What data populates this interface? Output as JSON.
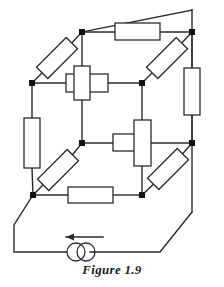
{
  "figure": {
    "caption": "Figure 1.9",
    "title": "Figure 1.9",
    "type": "circuit-schematic",
    "colors": {
      "wire": "#2b2b2b",
      "node": "#111111",
      "resistor_fill": "#ffffff",
      "resistor_stroke": "#2b2b2b",
      "background": "#ffffff",
      "caption_color": "#1a1a1a"
    },
    "stroke_width": 1.4
  },
  "circuit": {
    "element_counts": {
      "resistors": 12,
      "nodes": 8,
      "sources": 1
    },
    "source": {
      "kind": "current-source",
      "symbol": "two-overlapping-circles",
      "arrow_direction": "left",
      "cx": 81,
      "cy": 252,
      "r": 9
    },
    "nodes": [
      {
        "id": "top-back-left",
        "x": 82,
        "y": 32,
        "label": ""
      },
      {
        "id": "top-back-right",
        "x": 192,
        "y": 32,
        "label": ""
      },
      {
        "id": "top-front-left",
        "x": 32,
        "y": 83,
        "label": ""
      },
      {
        "id": "top-front-right",
        "x": 142,
        "y": 83,
        "label": ""
      },
      {
        "id": "bot-back-left",
        "x": 82,
        "y": 143,
        "label": ""
      },
      {
        "id": "bot-back-right",
        "x": 192,
        "y": 143,
        "label": ""
      },
      {
        "id": "bot-front-left",
        "x": 33,
        "y": 195,
        "label": ""
      },
      {
        "id": "bot-front-right",
        "x": 142,
        "y": 195,
        "label": ""
      }
    ],
    "resistors": [
      {
        "id": "r-top-back",
        "orientation": "horizontal",
        "edge": "top-back-left → top-back-right",
        "label": ""
      },
      {
        "id": "r-top-front",
        "orientation": "horizontal",
        "edge": "bot-back-left → bot-back-right",
        "label": ""
      },
      {
        "id": "r-bottom-front",
        "orientation": "horizontal",
        "edge": "bot-front-left → bot-front-right",
        "label": ""
      },
      {
        "id": "r-left-diagonal-top",
        "orientation": "diagonal",
        "edge": "top-front-left → top-back-left",
        "label": ""
      },
      {
        "id": "r-right-diagonal-top",
        "orientation": "diagonal",
        "edge": "top-front-right → top-back-right",
        "label": ""
      },
      {
        "id": "r-left-diagonal-bottom",
        "orientation": "diagonal",
        "edge": "bot-front-left → bot-back-left",
        "label": ""
      },
      {
        "id": "r-right-diagonal-bottom",
        "orientation": "diagonal",
        "edge": "bot-front-right → bot-back-right",
        "label": ""
      },
      {
        "id": "r-left-vertical",
        "orientation": "vertical",
        "edge": "top-front-left → bot-front-left",
        "label": ""
      },
      {
        "id": "r-right-vertical",
        "orientation": "vertical",
        "edge": "top-back-right → bot-back-right",
        "label": ""
      },
      {
        "id": "r-center-vertical",
        "orientation": "vertical",
        "edge": "top-back-left → bot-back-left",
        "label": ""
      },
      {
        "id": "r-mid-vertical",
        "orientation": "vertical",
        "edge": "top-front-right → bot-front-right",
        "label": ""
      },
      {
        "id": "r-mid-horizontal",
        "orientation": "horizontal",
        "edge": "bot-back-left → bot-front-right",
        "label": ""
      }
    ]
  }
}
